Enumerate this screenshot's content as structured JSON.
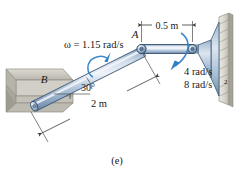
{
  "figure": {
    "caption": "(e)",
    "labels": {
      "omega_rod": "ω = 1.15 rad/s",
      "point_a": "A",
      "point_b": "B",
      "angle_30": "30°",
      "length_2m": "2 m",
      "length_05m": "0.5 m",
      "omega_link": "4 rad/s",
      "alpha_link": "8 rad/s",
      "alpha_exponent": "2"
    },
    "colors": {
      "rod_body": "#a8bcd4",
      "rod_highlight": "#e6edf5",
      "rod_shadow": "#6d88a8",
      "rod_outline": "#34506e",
      "arrow_blue": "#2f7fc4",
      "support_fill": "#c9c7bd",
      "support_top": "#d9d7cd",
      "support_edge": "#8f8d84",
      "wall_fill": "#dcdad2",
      "dim_line": "#4a4a4a",
      "text": "#1a1a1a",
      "background": "#ffffff"
    }
  }
}
